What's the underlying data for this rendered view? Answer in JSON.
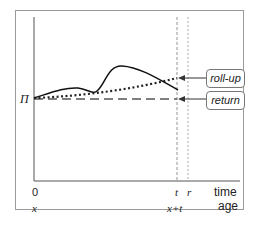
{
  "diagram": {
    "y_axis_start_label": "Π",
    "x_axis": {
      "time_labels": {
        "origin": "0",
        "t": "t",
        "r": "r",
        "axis": "time"
      },
      "age_labels": {
        "origin": "x",
        "x_plus_t": "x+t",
        "axis": "age"
      }
    },
    "legend": {
      "roll_up": "roll-up",
      "return": "return"
    }
  }
}
